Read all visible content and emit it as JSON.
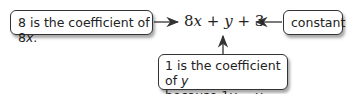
{
  "callouts": {
    "left": {
      "text_prefix": "8 is the coefficient of 8",
      "text_var": "x",
      "text_suffix": "."
    },
    "right": {
      "text": "constant"
    },
    "bottom": {
      "line1_prefix": "1 is the coefficient of ",
      "line1_var": "y",
      "line2_prefix": "because 1",
      "line2_var1": "y",
      "line2_mid": " = ",
      "line2_var2": "y",
      "line2_suffix": "."
    }
  },
  "expression": {
    "t1_coef": "8",
    "t1_var": "x",
    "op1": " + ",
    "t2_var": "y",
    "op2": " + ",
    "t3": "3"
  },
  "colors": {
    "line": "#333333",
    "text": "#222222",
    "background": "#ffffff"
  }
}
